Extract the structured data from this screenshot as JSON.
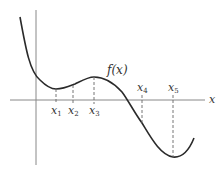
{
  "diagram": {
    "function_label": "f(x)",
    "axis_label_x": "x",
    "points": [
      {
        "label": "x",
        "sub": "1",
        "x": 56,
        "curve_y": 89,
        "label_pos": "below"
      },
      {
        "label": "x",
        "sub": "2",
        "x": 73,
        "curve_y": 85,
        "label_pos": "below"
      },
      {
        "label": "x",
        "sub": "3",
        "x": 94,
        "curve_y": 77,
        "label_pos": "below"
      },
      {
        "label": "x",
        "sub": "4",
        "x": 142,
        "curve_y": 123,
        "label_pos": "above"
      },
      {
        "label": "x",
        "sub": "5",
        "x": 173,
        "curve_y": 157,
        "label_pos": "above"
      }
    ],
    "colors": {
      "curve": "#2a2a2a",
      "axis": "#888888",
      "dashed": "#666666",
      "text": "#333333"
    }
  }
}
